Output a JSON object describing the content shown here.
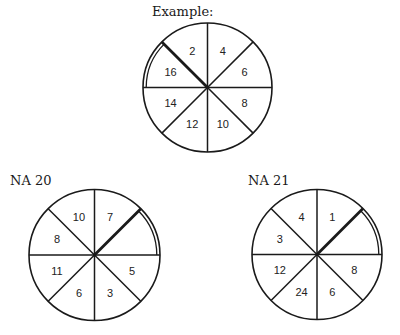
{
  "diagrams": [
    {
      "id": "example",
      "title": "Example:",
      "title_pos": [
        152,
        5
      ],
      "center": [
        207.5,
        87.5
      ],
      "radius": 64.5,
      "sectors_clockwise_from_top": [
        "4",
        "6",
        "8",
        "10",
        "12",
        "14",
        "16",
        "2"
      ],
      "thick_line_angle_deg": 135,
      "double_arc_deg": [
        135,
        180
      ]
    },
    {
      "id": "na20",
      "title": "NA 20",
      "title_pos": [
        10,
        175
      ],
      "center": [
        94.5,
        255
      ],
      "radius": 65.5,
      "sectors_clockwise_from_top": [
        "7",
        "",
        "5",
        "3",
        "6",
        "11",
        "8",
        "10"
      ],
      "thick_line_angle_deg": 45,
      "double_arc_deg": [
        0,
        45
      ]
    },
    {
      "id": "na21",
      "title": "NA 21",
      "title_pos": [
        248,
        175
      ],
      "center": [
        317,
        254.5
      ],
      "radius": 65,
      "sectors_clockwise_from_top": [
        "1",
        "",
        "8",
        "6",
        "24",
        "12",
        "3",
        "4"
      ],
      "thick_line_angle_deg": 45,
      "double_arc_deg": [
        0,
        45
      ]
    }
  ],
  "colors": {
    "line": "#1a1a1a",
    "background": "#ffffff"
  }
}
